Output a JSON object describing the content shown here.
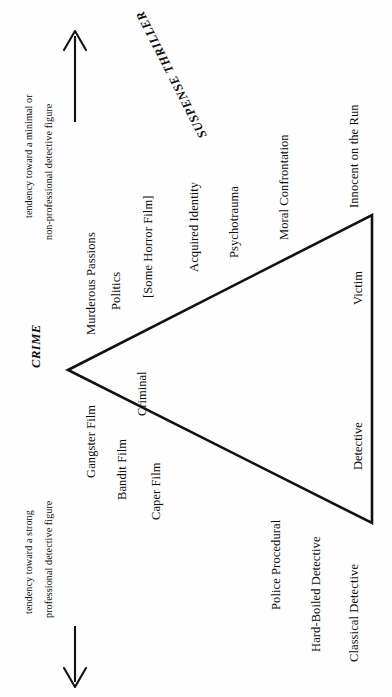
{
  "diagram": {
    "background_color": "#fefefe",
    "line_color": "#111111",
    "categories": {
      "crime": "CRIME",
      "suspense_thriller": "SUSPENSE THRILLER"
    },
    "axis_notes": {
      "top": "tendency toward a minimal or",
      "top_second": "non-professional detective figure",
      "bottom": "tendency toward a strong",
      "bottom_second": "professional detective figure"
    },
    "arrows": {
      "up": "up-arrow",
      "down": "down-arrow"
    },
    "upper_edge_labels": [
      "Murderous Passions",
      "Politics",
      "[Some Horror Film]",
      "Acquired Identity",
      "Psychotrauma",
      "Moral Confrontation",
      "Innocent on the Run"
    ],
    "lower_edge_labels": [
      "Gangster Film",
      "Bandit Film",
      "Caper Film",
      "Police Procedural",
      "Hard-Boiled Detective",
      "Classical Detective"
    ],
    "inner_labels": [
      "Criminal",
      "Victim",
      "Detective"
    ]
  }
}
